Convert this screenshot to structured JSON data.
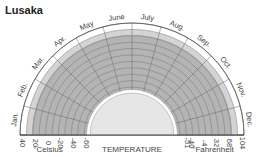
{
  "title": "Lusaka",
  "chart_data": {
    "type": "radial-band",
    "title": "Lusaka",
    "xlabel": "TEMPERATURE",
    "months": [
      "Jan.",
      "Feb.",
      "Mar.",
      "Apr.",
      "May",
      "June",
      "July",
      "Aug.",
      "Sep.",
      "Oct.",
      "Nov.",
      "Dec."
    ],
    "celsius_ticks": [
      "40",
      "20",
      "0",
      "-20",
      "-40",
      "-60"
    ],
    "fahrenheit_ticks": [
      "-51",
      "-40",
      "-4",
      "32",
      "68",
      "104"
    ],
    "celsius_label": "°Celsius",
    "fahrenheit_label": "°Fahrenheit",
    "range_celsius": [
      -60,
      40
    ],
    "series": [
      {
        "name": "typical range (dark band)",
        "min_c": -60,
        "max_c": 22
      },
      {
        "name": "upper range (light band)",
        "min_c": 22,
        "max_c": 30
      }
    ],
    "colors": {
      "dark_band": "#b4b4b4",
      "light_band": "#d4d4d4",
      "outer": "#ffffff",
      "inner_hole": "#e6e6e6",
      "grid": "#555555"
    }
  },
  "labels": {
    "celsius": "°Celsius",
    "temperature": "TEMPERATURE",
    "fahrenheit": "°Fahrenheit"
  }
}
